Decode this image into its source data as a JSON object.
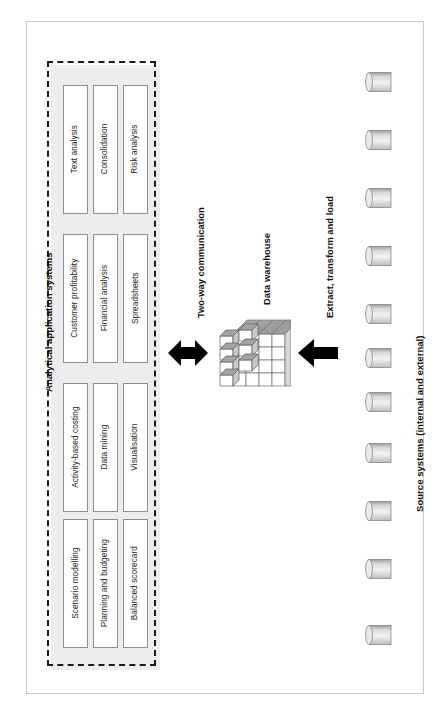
{
  "figure": {
    "title_present": false,
    "background": "#ffffff",
    "frame_color": "#c9c9c9",
    "dash_color": "#1b1b1b",
    "box_border_color": "#8f8f8f",
    "arrow_color": "#000000"
  },
  "analytical_section": {
    "heading": "Analytical application systems",
    "clusters": [
      {
        "cluster_name": "cluster-text-consolidation-risk",
        "boxes": [
          {
            "label": "Text analysis"
          },
          {
            "label": "Consolidation"
          },
          {
            "label": "Risk analysis"
          }
        ]
      },
      {
        "cluster_name": "cluster-customer-financial-spreadsheets",
        "boxes": [
          {
            "label": "Customer profitability"
          },
          {
            "label": "Financial analysis"
          },
          {
            "label": "Spreadsheets"
          }
        ]
      },
      {
        "cluster_name": "cluster-abc-datamining-visualisation",
        "boxes": [
          {
            "label": "Activity-based costing"
          },
          {
            "label": "Data mining"
          },
          {
            "label": "Visualisation"
          }
        ]
      },
      {
        "cluster_name": "cluster-scenario-planning-scorecard",
        "boxes": [
          {
            "label": "Scenario modelling"
          },
          {
            "label": "Planning and budgeting"
          },
          {
            "label": "Balanced scorecard"
          }
        ]
      }
    ]
  },
  "connectors": {
    "two_way": {
      "label": "Two-way communication",
      "icon": "double-headed-arrow-icon",
      "direction": "bidirectional"
    },
    "etl": {
      "label": "Extract, transform and load",
      "icon": "left-arrow-icon",
      "direction": "left"
    }
  },
  "warehouse": {
    "label": "Data warehouse",
    "icon": "data-cube-icon",
    "grid": "4x4x4"
  },
  "source_systems": {
    "heading": "Source systems (internal and external)",
    "icon": "database-cylinder-icon",
    "count": 11,
    "items": [
      {
        "name": "source-system-1"
      },
      {
        "name": "source-system-2"
      },
      {
        "name": "source-system-3"
      },
      {
        "name": "source-system-4"
      },
      {
        "name": "source-system-5"
      },
      {
        "name": "source-system-6"
      },
      {
        "name": "source-system-7"
      },
      {
        "name": "source-system-8"
      },
      {
        "name": "source-system-9"
      },
      {
        "name": "source-system-10"
      },
      {
        "name": "source-system-11"
      }
    ]
  }
}
